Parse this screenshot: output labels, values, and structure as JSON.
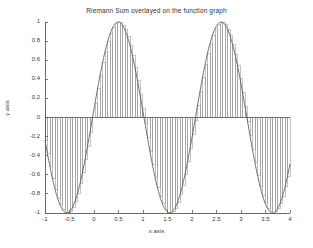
{
  "chart_data": {
    "type": "line",
    "title": "Riemann Sum overlayed on the function graph",
    "xlabel": "x axis",
    "ylabel": "y axis",
    "xlim": [
      -1,
      4
    ],
    "ylim": [
      -1,
      1
    ],
    "grid": false,
    "legend": "none",
    "xticks": [
      "-1",
      "-0.5",
      "0",
      "0.5",
      "1",
      "1.5",
      "2",
      "2.5",
      "3",
      "3.5",
      "4"
    ],
    "xtick_values": [
      -1,
      -0.5,
      0,
      0.5,
      1,
      1.5,
      2,
      2.5,
      3,
      3.5,
      4
    ],
    "yticks": [
      "1",
      "0.8",
      "0.6",
      "0.4",
      "0.2",
      "0",
      "-0.2",
      "-0.4",
      "-0.6",
      "-0.8",
      "-1"
    ],
    "ytick_values": [
      1,
      0.8,
      0.6,
      0.4,
      0.2,
      0,
      -0.2,
      -0.4,
      -0.6,
      -0.8,
      -1
    ],
    "function": {
      "name": "sine-curve",
      "expression": "sin(2*pi*(x+0.03)/2.1)",
      "amplitude": 1,
      "period": 2.1,
      "phase_shift": 0.03,
      "peaks_x": [
        0.5,
        2.6
      ],
      "troughs_x": [
        -0.55,
        1.55,
        3.68
      ],
      "zero_crossings_x": [
        -1.05,
        0.0,
        1.05,
        2.1,
        3.15
      ]
    },
    "riemann_sum": {
      "name": "riemann-rectangles",
      "rule": "left-endpoint",
      "n_rectangles": 98,
      "interval": [
        -1,
        4
      ],
      "delta_x": 0.051
    },
    "series": [
      {
        "name": "function graph",
        "x": [
          -1,
          -0.9,
          -0.8,
          -0.7,
          -0.6,
          -0.5,
          -0.4,
          -0.3,
          -0.2,
          -0.1,
          0,
          0.1,
          0.2,
          0.3,
          0.4,
          0.5,
          0.6,
          0.7,
          0.8,
          0.9,
          1,
          1.1,
          1.2,
          1.3,
          1.4,
          1.5,
          1.6,
          1.7,
          1.8,
          1.9,
          2,
          2.1,
          2.2,
          2.3,
          2.4,
          2.5,
          2.6,
          2.7,
          2.8,
          2.9,
          3,
          3.1,
          3.2,
          3.3,
          3.4,
          3.5,
          3.6,
          3.7,
          3.8,
          3.9,
          4
        ],
        "values": [
          -0.15,
          -0.43,
          -0.67,
          -0.86,
          -0.97,
          -1.0,
          -0.96,
          -0.84,
          -0.65,
          -0.41,
          -0.09,
          0.18,
          0.48,
          0.71,
          0.89,
          0.99,
          1.0,
          0.93,
          0.78,
          0.56,
          0.27,
          0.0,
          -0.27,
          -0.56,
          -0.78,
          -0.93,
          -1.0,
          -0.99,
          -0.89,
          -0.71,
          -0.48,
          -0.18,
          0.09,
          0.41,
          0.65,
          0.84,
          0.96,
          1.0,
          0.97,
          0.86,
          0.67,
          0.43,
          0.15,
          -0.15,
          -0.43,
          -0.67,
          -0.86,
          -0.97,
          -1.0,
          -0.96,
          -0.84
        ]
      }
    ]
  },
  "figure": {
    "background_color": "#ffffff",
    "axis_color": "#5a5a5a",
    "curve_color": "#555555",
    "rect_color": "#888888"
  }
}
